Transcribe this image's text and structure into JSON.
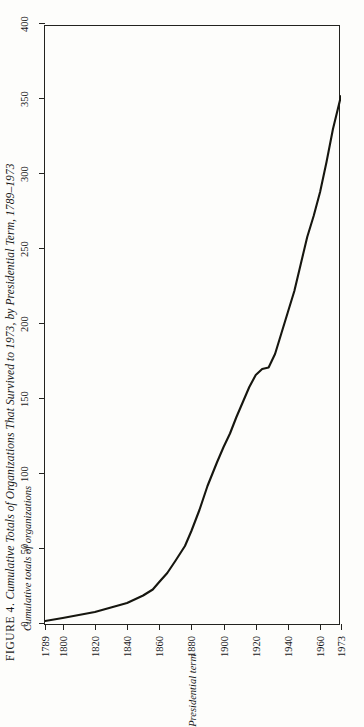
{
  "caption": {
    "figure_number": "FIGURE 4.",
    "text": "Cumulative Totals of Organizations That Survived to 1973, by Presidential Term, 1789–1973"
  },
  "chart_data": {
    "type": "line",
    "title": "Cumulative Totals of Organizations That Survived to 1973, by Presidential Term, 1789–1973",
    "orientation": "rotated-90-ccw",
    "xlabel": "Presidential term",
    "ylabel": "Cumulative totals of organizations",
    "xlim": [
      1789,
      1973
    ],
    "ylim": [
      0,
      400
    ],
    "grid": false,
    "legend": "none",
    "xticklabels": [
      "1789",
      "1800",
      "1820",
      "1840",
      "1860",
      "1880",
      "1900",
      "1920",
      "1940",
      "1960",
      "1973"
    ],
    "xtickvalues": [
      1789,
      1800,
      1820,
      1840,
      1860,
      1880,
      1900,
      1920,
      1940,
      1960,
      1973
    ],
    "yticklabels": [
      "0",
      "50",
      "100",
      "150",
      "200",
      "250",
      "300",
      "350",
      "400"
    ],
    "ytickvalues": [
      0,
      50,
      100,
      150,
      200,
      250,
      300,
      350,
      400
    ],
    "series": [
      {
        "name": "Cumulative totals of organizations",
        "x": [
          1789,
          1800,
          1810,
          1820,
          1830,
          1840,
          1850,
          1856,
          1860,
          1865,
          1870,
          1876,
          1880,
          1885,
          1890,
          1896,
          1900,
          1904,
          1908,
          1912,
          1916,
          1920,
          1924,
          1928,
          1932,
          1936,
          1940,
          1944,
          1948,
          1952,
          1956,
          1960,
          1964,
          1968,
          1973
        ],
        "y": [
          2,
          4,
          6,
          8,
          11,
          14,
          19,
          23,
          28,
          34,
          42,
          52,
          62,
          76,
          92,
          108,
          118,
          127,
          138,
          148,
          158,
          166,
          170,
          171,
          180,
          194,
          208,
          222,
          240,
          258,
          272,
          288,
          308,
          330,
          352
        ]
      }
    ]
  }
}
